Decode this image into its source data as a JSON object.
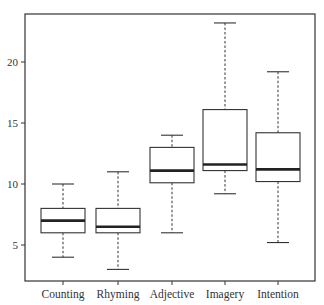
{
  "chart_data": {
    "type": "box",
    "title": "",
    "xlabel": "",
    "ylabel": "",
    "ylim": [
      1.9,
      24.0
    ],
    "yticks": [
      5,
      10,
      15,
      20
    ],
    "grid": false,
    "legend": null,
    "categories": [
      "Counting",
      "Rhyming",
      "Adjective",
      "Imagery",
      "Intention"
    ],
    "boxes": [
      {
        "name": "Counting",
        "min": 4.0,
        "q1": 6.0,
        "median": 7.0,
        "q3": 8.0,
        "max": 10.0
      },
      {
        "name": "Rhyming",
        "min": 3.0,
        "q1": 6.0,
        "median": 6.5,
        "q3": 8.0,
        "max": 11.0
      },
      {
        "name": "Adjective",
        "min": 6.0,
        "q1": 10.1,
        "median": 11.1,
        "q3": 13.0,
        "max": 14.0
      },
      {
        "name": "Imagery",
        "min": 9.2,
        "q1": 11.1,
        "median": 11.6,
        "q3": 16.1,
        "max": 23.2
      },
      {
        "name": "Intention",
        "min": 5.2,
        "q1": 10.2,
        "median": 11.2,
        "q3": 14.2,
        "max": 19.2
      }
    ]
  },
  "layout": {
    "frame": {
      "left": 25,
      "top": 14,
      "right": 315,
      "bottom": 281
    },
    "y_px_per_unit": 12.2,
    "y_zero_px": 306,
    "box_centers": [
      63,
      118,
      172,
      225,
      278
    ],
    "box_half_width": 22,
    "cap_half_width": 11
  }
}
